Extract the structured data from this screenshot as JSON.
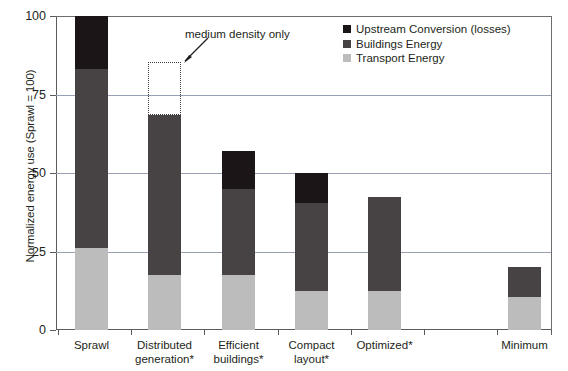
{
  "chart_data": {
    "type": "bar",
    "subtype": "stacked-bar",
    "title": "",
    "xlabel": "",
    "ylabel": "Normalized energy use (Sprawl = 100)",
    "ylim": [
      0,
      100
    ],
    "yticks": [
      0,
      25,
      50,
      75,
      100
    ],
    "grid": true,
    "legend_position": "top-right",
    "categories": [
      "Sprawl",
      "Distributed generation*",
      "Efficient buildings*",
      "Compact layout*",
      "Optimized*",
      "Minimum"
    ],
    "category_lines": [
      [
        "Sprawl"
      ],
      [
        "Distributed",
        "generation*"
      ],
      [
        "Efficient",
        "buildings*"
      ],
      [
        "Compact",
        "layout*"
      ],
      [
        "Optimized*"
      ],
      [
        "Minimum"
      ]
    ],
    "series": [
      {
        "name": "Transport Energy",
        "color": "#bcbcbc",
        "values": [
          26,
          17.5,
          17.5,
          12.5,
          12.5,
          10.5
        ]
      },
      {
        "name": "Buildings Energy",
        "color": "#474344",
        "values": [
          57,
          51,
          27.5,
          28,
          30,
          9.5
        ]
      },
      {
        "name": "Upstream Conversion (losses)",
        "color": "#1b1517",
        "values": [
          17,
          0,
          12,
          9.5,
          0,
          0
        ]
      }
    ],
    "totals": [
      100,
      68.5,
      57,
      50,
      42.5,
      20
    ],
    "annotations": [
      {
        "text": "medium density only",
        "target_category": "Distributed generation*",
        "range": [
          68.5,
          85.5
        ],
        "style": "dashed-outline-box-with-arrow"
      }
    ]
  },
  "legend": {
    "entries": [
      {
        "label": "Upstream Conversion (losses)",
        "color": "#1b1517"
      },
      {
        "label": "Buildings Energy",
        "color": "#474344"
      },
      {
        "label": "Transport Energy",
        "color": "#bcbcbc"
      }
    ]
  },
  "axis": {
    "y_title": "Normalized energy use (Sprawl = 100)",
    "y_tick_labels": [
      "100",
      "75",
      "50",
      "25",
      "0"
    ]
  }
}
